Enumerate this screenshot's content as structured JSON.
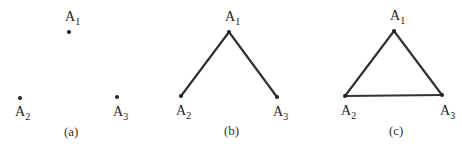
{
  "panels": [
    {
      "caption": "(a)",
      "points": [
        {
          "name": "A",
          "sub": "1",
          "x": 69,
          "y": 32
        },
        {
          "name": "A",
          "sub": "2",
          "x": 20,
          "y": 98
        },
        {
          "name": "A",
          "sub": "3",
          "x": 117,
          "y": 97
        }
      ],
      "edges": []
    },
    {
      "caption": "(b)",
      "points": [
        {
          "name": "A",
          "sub": "1",
          "x": 229,
          "y": 32
        },
        {
          "name": "A",
          "sub": "2",
          "x": 181,
          "y": 96
        },
        {
          "name": "A",
          "sub": "3",
          "x": 277,
          "y": 97
        }
      ],
      "edges": [
        [
          "A1",
          "A2"
        ],
        [
          "A1",
          "A3"
        ]
      ]
    },
    {
      "caption": "(c)",
      "points": [
        {
          "name": "A",
          "sub": "1",
          "x": 394,
          "y": 31
        },
        {
          "name": "A",
          "sub": "2",
          "x": 345,
          "y": 96
        },
        {
          "name": "A",
          "sub": "3",
          "x": 442,
          "y": 95
        }
      ],
      "edges": [
        [
          "A1",
          "A2"
        ],
        [
          "A1",
          "A3"
        ],
        [
          "A2",
          "A3"
        ]
      ]
    }
  ]
}
